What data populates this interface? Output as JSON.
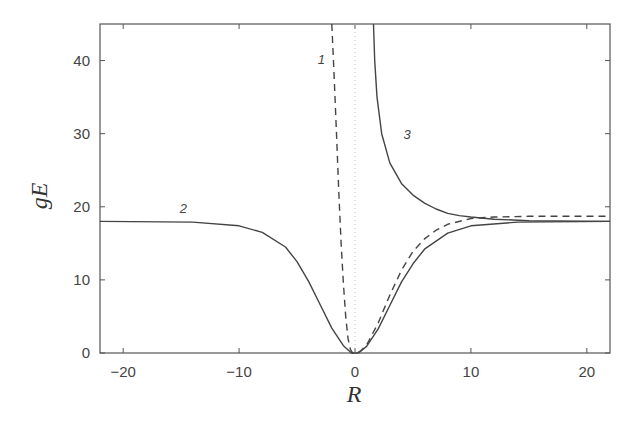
{
  "chart_data": {
    "type": "line",
    "title": "",
    "xlabel": "R",
    "ylabel": "gE",
    "xlim": [
      -22,
      22
    ],
    "ylim": [
      0,
      45
    ],
    "grid": false,
    "legend": "none (inline curve labels)",
    "x_ticks": [
      -20,
      -10,
      0,
      10,
      20
    ],
    "x_tick_labels": [
      "−20",
      "−10",
      "0",
      "10",
      "20"
    ],
    "y_ticks": [
      0,
      10,
      20,
      30,
      40
    ],
    "y_tick_labels": [
      "0",
      "10",
      "20",
      "30",
      "40"
    ],
    "annotations": [
      {
        "text": "1",
        "x": -2.9,
        "y": 39.5
      },
      {
        "text": "2",
        "x": -14.8,
        "y": 19.2
      },
      {
        "text": "3",
        "x": 4.5,
        "y": 29.3
      }
    ],
    "reference_line": {
      "style": "dotted",
      "x": 0
    },
    "series": [
      {
        "name": "1",
        "style": "dashed",
        "points": [
          [
            -2.0,
            45
          ],
          [
            -1.8,
            38
          ],
          [
            -1.6,
            30
          ],
          [
            -1.4,
            22
          ],
          [
            -1.2,
            15
          ],
          [
            -1.0,
            9.5
          ],
          [
            -0.8,
            5
          ],
          [
            -0.6,
            2
          ],
          [
            -0.4,
            0.5
          ],
          [
            -0.2,
            0
          ],
          [
            0.2,
            0
          ],
          [
            0.5,
            0.3
          ],
          [
            1,
            1.1
          ],
          [
            2,
            4.1
          ],
          [
            3,
            7.9
          ],
          [
            4,
            11.3
          ],
          [
            5,
            13.9
          ],
          [
            6,
            15.6
          ],
          [
            7,
            16.8
          ],
          [
            8,
            17.6
          ],
          [
            10,
            18.4
          ],
          [
            12,
            18.6
          ],
          [
            15,
            18.7
          ],
          [
            22,
            18.7
          ]
        ]
      },
      {
        "name": "2",
        "style": "solid",
        "points": [
          [
            -22,
            18
          ],
          [
            -14,
            17.9
          ],
          [
            -10,
            17.4
          ],
          [
            -8,
            16.5
          ],
          [
            -6,
            14.5
          ],
          [
            -5,
            12.5
          ],
          [
            -4,
            9.8
          ],
          [
            -3,
            6.6
          ],
          [
            -2,
            3.4
          ],
          [
            -1,
            1.0
          ],
          [
            -0.3,
            0
          ],
          [
            0.3,
            0
          ],
          [
            1,
            0.9
          ],
          [
            2,
            3.3
          ],
          [
            3,
            6.5
          ],
          [
            4,
            9.7
          ],
          [
            5,
            12.2
          ],
          [
            6,
            14.2
          ],
          [
            8,
            16.4
          ],
          [
            10,
            17.4
          ],
          [
            14,
            17.9
          ],
          [
            22,
            18
          ]
        ]
      },
      {
        "name": "3",
        "style": "solid",
        "points": [
          [
            1.6,
            45
          ],
          [
            1.7,
            40
          ],
          [
            1.9,
            35
          ],
          [
            2.3,
            30
          ],
          [
            3,
            26
          ],
          [
            4,
            23.2
          ],
          [
            5,
            21.6
          ],
          [
            6,
            20.5
          ],
          [
            7,
            19.7
          ],
          [
            8,
            19.1
          ],
          [
            9,
            18.8
          ],
          [
            10,
            18.6
          ],
          [
            12,
            18.3
          ],
          [
            15,
            18.1
          ],
          [
            22,
            18
          ]
        ]
      }
    ]
  }
}
